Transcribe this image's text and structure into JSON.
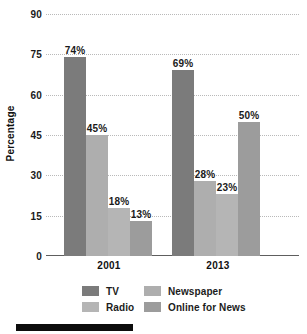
{
  "chart_data": {
    "type": "bar",
    "title": "",
    "xlabel": "",
    "ylabel": "Percentage",
    "categories": [
      "2001",
      "2013"
    ],
    "ylim": [
      0,
      90
    ],
    "yticks": [
      0,
      15,
      30,
      45,
      60,
      75,
      90
    ],
    "ytick_labels": [
      "0",
      "15",
      "30",
      "45",
      "60",
      "75",
      "90"
    ],
    "grid": true,
    "legend_position": "bottom",
    "value_suffix": "%",
    "series": [
      {
        "name": "TV",
        "color": "#7b7b7b",
        "values": [
          74,
          69
        ],
        "labels": [
          "74%",
          "69%"
        ]
      },
      {
        "name": "Newspaper",
        "color": "#aeaeae",
        "values": [
          45,
          28
        ],
        "labels": [
          "45%",
          "28%"
        ]
      },
      {
        "name": "Radio",
        "color": "#b5b5b5",
        "values": [
          18,
          23
        ],
        "labels": [
          "18%",
          "23%"
        ]
      },
      {
        "name": "Online for News",
        "color": "#9c9c9c",
        "values": [
          13,
          50
        ],
        "labels": [
          "13%",
          "50%"
        ]
      }
    ]
  },
  "axis": {
    "y_title": "Percentage",
    "y_labels": {
      "t0": "0",
      "t15": "15",
      "t30": "30",
      "t45": "45",
      "t60": "60",
      "t75": "75",
      "t90": "90"
    },
    "x_labels": {
      "g0": "2001",
      "g1": "2013"
    }
  },
  "bars": {
    "g0": {
      "tv": "74%",
      "newspaper": "45%",
      "radio": "18%",
      "online": "13%"
    },
    "g1": {
      "tv": "69%",
      "newspaper": "28%",
      "radio": "23%",
      "online": "50%"
    }
  },
  "legend": {
    "tv": "TV",
    "newspaper": "Newspaper",
    "radio": "Radio",
    "online": "Online for News"
  },
  "colors": {
    "tv": "#7b7b7b",
    "newspaper": "#aeaeae",
    "radio": "#b5b5b5",
    "online": "#9c9c9c",
    "gridline": "#b9b9b9",
    "axis": "#5e5e5e",
    "text": "#1a1a1a",
    "rule": "#0d0d0d"
  }
}
